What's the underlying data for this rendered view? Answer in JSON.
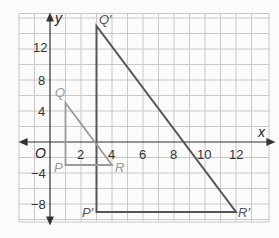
{
  "axes": {
    "x_label": "x",
    "y_label": "y",
    "origin_label": "O",
    "x_ticks": [
      "2",
      "4",
      "6",
      "8",
      "10",
      "12"
    ],
    "y_ticks": [
      "12",
      "8",
      "4",
      "−4",
      "−8"
    ]
  },
  "triangles": [
    {
      "name": "PQR",
      "color": "#9a9a9a",
      "vertices": [
        {
          "label": "P",
          "x": 1,
          "y": -3
        },
        {
          "label": "Q",
          "x": 1,
          "y": 5
        },
        {
          "label": "R",
          "x": 4,
          "y": -3
        }
      ]
    },
    {
      "name": "P'Q'R'",
      "color": "#555555",
      "vertices": [
        {
          "label": "P′",
          "x": 3,
          "y": -9
        },
        {
          "label": "Q′",
          "x": 3,
          "y": 15
        },
        {
          "label": "R′",
          "x": 12,
          "y": -9
        }
      ]
    }
  ],
  "colors": {
    "grid": "#c8c8c8",
    "axis": "#333333",
    "small_triangle": "#9a9a9a",
    "large_triangle": "#555555"
  }
}
